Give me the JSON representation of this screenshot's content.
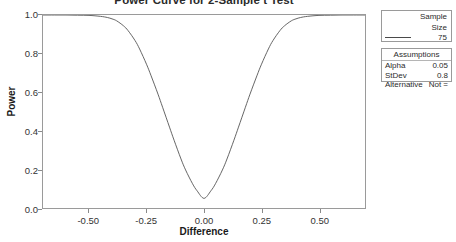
{
  "chart_data": {
    "type": "line",
    "title": "Power Curve for 2-Sample t Test",
    "xlabel": "Difference",
    "ylabel": "Power",
    "xlim": [
      -0.7,
      0.7
    ],
    "ylim": [
      0.0,
      1.0
    ],
    "grid": false,
    "legend_position": "right",
    "xticks": [
      "-0.50",
      "-0.25",
      "0.00",
      "0.25",
      "0.50"
    ],
    "xtick_values": [
      -0.5,
      -0.25,
      0.0,
      0.25,
      0.5
    ],
    "yticks": [
      "0.0",
      "0.2",
      "0.4",
      "0.6",
      "0.8",
      "1.0"
    ],
    "ytick_values": [
      0.0,
      0.2,
      0.4,
      0.6,
      0.8,
      1.0
    ],
    "series": [
      {
        "name": "75",
        "color": "#555555",
        "x": [
          -0.7,
          -0.65,
          -0.6,
          -0.55,
          -0.5,
          -0.45,
          -0.42,
          -0.4,
          -0.38,
          -0.35,
          -0.33,
          -0.3,
          -0.28,
          -0.25,
          -0.23,
          -0.2,
          -0.18,
          -0.15,
          -0.13,
          -0.1,
          -0.08,
          -0.05,
          -0.03,
          0.0,
          0.03,
          0.05,
          0.08,
          0.1,
          0.13,
          0.15,
          0.18,
          0.2,
          0.23,
          0.25,
          0.28,
          0.3,
          0.33,
          0.35,
          0.38,
          0.4,
          0.42,
          0.45,
          0.5,
          0.55,
          0.6,
          0.65,
          0.7
        ],
        "y": [
          1.0,
          1.0,
          1.0,
          0.999,
          0.998,
          0.993,
          0.987,
          0.98,
          0.97,
          0.944,
          0.919,
          0.868,
          0.824,
          0.745,
          0.685,
          0.59,
          0.522,
          0.419,
          0.351,
          0.254,
          0.197,
          0.126,
          0.089,
          0.05,
          0.089,
          0.126,
          0.197,
          0.254,
          0.351,
          0.419,
          0.522,
          0.59,
          0.685,
          0.745,
          0.824,
          0.868,
          0.919,
          0.944,
          0.97,
          0.98,
          0.987,
          0.993,
          0.998,
          0.999,
          1.0,
          1.0,
          1.0
        ]
      }
    ]
  },
  "legend": {
    "sample": {
      "header_line1": "Sample",
      "header_line2": "Size",
      "value": "75"
    },
    "assumptions": {
      "header": "Assumptions",
      "rows": [
        {
          "key": "Alpha",
          "value": "0.05"
        },
        {
          "key": "StDev",
          "value": "0.8"
        },
        {
          "key": "Alternative",
          "value": "Not ="
        }
      ]
    }
  }
}
